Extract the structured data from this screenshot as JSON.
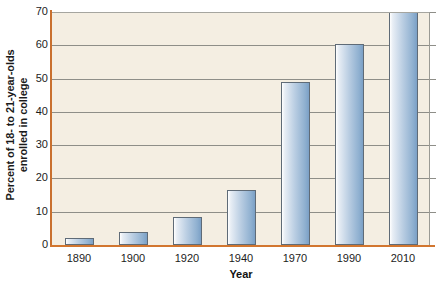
{
  "chart_data": {
    "type": "bar",
    "title": "",
    "xlabel": "Year",
    "ylabel": "Percent of 18- to 21-year-olds enrolled in college",
    "ylabel_line1": "Percent of 18- to 21-year-olds",
    "ylabel_line2": "enrolled in college",
    "categories": [
      "1890",
      "1900",
      "1920",
      "1940",
      "1970",
      "1990",
      "2010"
    ],
    "values": [
      2,
      4,
      8.5,
      16.5,
      49,
      60.5,
      70
    ],
    "series": [
      {
        "name": "Percent enrolled in college",
        "values": [
          2,
          4,
          8.5,
          16.5,
          49,
          60.5,
          70
        ]
      }
    ],
    "ylim": [
      0,
      70
    ],
    "yticks": [
      0,
      10,
      20,
      30,
      40,
      50,
      60,
      70
    ],
    "ytick_labels": [
      "0",
      "10",
      "20",
      "30",
      "40",
      "50",
      "60",
      "70"
    ],
    "xlim_categories": 7,
    "grid": "horizontal",
    "legend": "none",
    "colors": {
      "plot_background": "#F4EEE2",
      "axis": "#C9702F",
      "gridline": "#8E8E88",
      "bar_fill_light": "#E8EEF5",
      "bar_fill_dark": "#7BA0C6",
      "bar_border": "#5F6B77",
      "text": "#1C1C1C",
      "page_background": "#FFFFFF"
    }
  }
}
